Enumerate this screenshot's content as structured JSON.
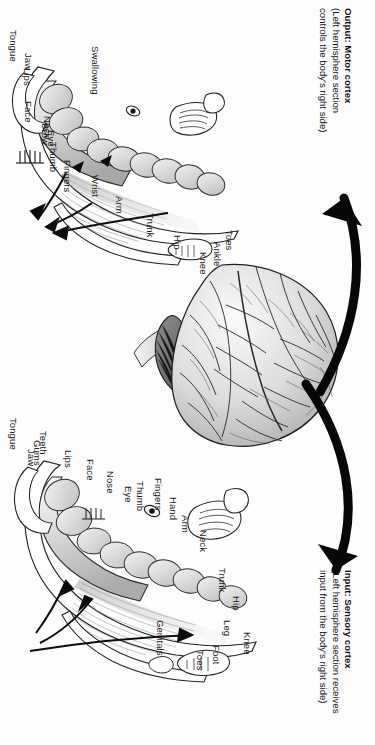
{
  "figure": {
    "orientation_deg": 90,
    "background_color": "#fdfdfd",
    "ink_color": "#1a1a1a"
  },
  "captions": {
    "motor": {
      "line1": "Output: Motor cortex",
      "line1_lead": "Output:",
      "line1_term": "Motor cortex",
      "line2": "(Left hemisphere section",
      "line3": "controls the body's right side)"
    },
    "sensory": {
      "line1": "Input: Sensory cortex",
      "line1_lead": "Input:",
      "line1_term": "Sensory cortex",
      "line2": "(Left hemisphere section receives",
      "line3": "input from the body's right side)"
    }
  },
  "motor_labels": [
    {
      "text": "Swallowing",
      "x": 46,
      "y": 100
    },
    {
      "text": "Tongue",
      "x": 30,
      "y": 18
    },
    {
      "text": "Jaw",
      "x": 53,
      "y": 33
    },
    {
      "text": "Lips",
      "x": 68,
      "y": 32
    },
    {
      "text": "Face",
      "x": 101,
      "y": 33
    },
    {
      "text": "Eye",
      "x": 130,
      "y": 56
    },
    {
      "text": "Brow",
      "x": 123,
      "y": 50
    },
    {
      "text": "Neck",
      "x": 116,
      "y": 52
    },
    {
      "text": "Thumb",
      "x": 142,
      "y": 58
    },
    {
      "text": "Fingers",
      "x": 160,
      "y": 72
    },
    {
      "text": "Wrist",
      "x": 175,
      "y": 100
    },
    {
      "text": "Arm",
      "x": 196,
      "y": 124
    },
    {
      "text": "Trunk",
      "x": 213,
      "y": 155
    },
    {
      "text": "Hip",
      "x": 235,
      "y": 182
    },
    {
      "text": "Knee",
      "x": 252,
      "y": 208
    },
    {
      "text": "Ankle",
      "x": 242,
      "y": 222
    },
    {
      "text": "Toes",
      "x": 230,
      "y": 234
    }
  ],
  "sensory_labels": [
    {
      "text": "Tongue",
      "x": 418,
      "y": 18
    },
    {
      "text": "Jaw",
      "x": 449,
      "y": 36
    },
    {
      "text": "Gums",
      "x": 440,
      "y": 42
    },
    {
      "text": "Teeth",
      "x": 431,
      "y": 48
    },
    {
      "text": "Lips",
      "x": 450,
      "y": 73
    },
    {
      "text": "Face",
      "x": 459,
      "y": 95
    },
    {
      "text": "Nose",
      "x": 471,
      "y": 115
    },
    {
      "text": "Eye",
      "x": 486,
      "y": 133
    },
    {
      "text": "Thumb",
      "x": 481,
      "y": 145
    },
    {
      "text": "Fingers",
      "x": 478,
      "y": 163
    },
    {
      "text": "Hand",
      "x": 497,
      "y": 178
    },
    {
      "text": "Arm",
      "x": 515,
      "y": 190
    },
    {
      "text": "Neck",
      "x": 530,
      "y": 208
    },
    {
      "text": "Trunk",
      "x": 568,
      "y": 227
    },
    {
      "text": "Hip",
      "x": 596,
      "y": 241
    },
    {
      "text": "Leg",
      "x": 620,
      "y": 232
    },
    {
      "text": "Knee",
      "x": 632,
      "y": 252
    },
    {
      "text": "Foot",
      "x": 645,
      "y": 221
    },
    {
      "text": "Toes",
      "x": 650,
      "y": 205
    },
    {
      "text": "Genitals",
      "x": 620,
      "y": 165
    }
  ],
  "arrows": [
    {
      "name": "motor-output-arrow",
      "direction": "brain-to-motor-cortex",
      "style": "curved-thick-black"
    },
    {
      "name": "sensory-input-arrow",
      "direction": "brain-to-sensory-cortex",
      "style": "curved-thick-black"
    }
  ],
  "illustrations": [
    {
      "name": "motor-homunculus",
      "description": "Motor cortex cross-section with outgoing arrows"
    },
    {
      "name": "whole-brain",
      "description": "Lateral view of whole human brain with cerebellum and brainstem"
    },
    {
      "name": "sensory-homunculus",
      "description": "Sensory cortex cross-section with incoming arrows"
    }
  ]
}
